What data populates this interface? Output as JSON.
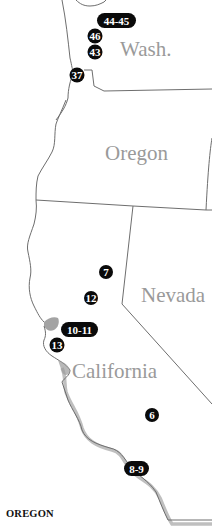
{
  "map": {
    "states": [
      {
        "id": "washington",
        "label": "Wash.",
        "x": 120,
        "y": 50
      },
      {
        "id": "oregon",
        "label": "Oregon",
        "x": 134,
        "y": 160
      },
      {
        "id": "nevada",
        "label": "Nevada",
        "x": 140,
        "y": 294
      },
      {
        "id": "california",
        "label": "California",
        "x": 72,
        "y": 365
      }
    ],
    "markers": [
      {
        "id": "marker-44-45",
        "label": "44-45",
        "x": 110,
        "y": 20,
        "w": 38
      },
      {
        "id": "marker-46",
        "label": "46",
        "x": 95,
        "y": 36,
        "w": 16
      },
      {
        "id": "marker-43",
        "label": "43",
        "x": 95,
        "y": 52,
        "w": 16
      },
      {
        "id": "marker-37",
        "label": "37",
        "x": 77,
        "y": 75,
        "w": 16
      },
      {
        "id": "marker-7",
        "label": "7",
        "x": 106,
        "y": 272,
        "w": 15
      },
      {
        "id": "marker-12",
        "label": "12",
        "x": 91,
        "y": 298,
        "w": 15
      },
      {
        "id": "marker-10-11",
        "label": "10-11",
        "x": 79,
        "y": 330,
        "w": 36
      },
      {
        "id": "marker-13",
        "label": "13",
        "x": 57,
        "y": 345,
        "w": 16
      },
      {
        "id": "marker-6",
        "label": "6",
        "x": 152,
        "y": 415,
        "w": 15
      },
      {
        "id": "marker-8-9",
        "label": "8-9",
        "x": 136,
        "y": 468,
        "w": 24
      }
    ],
    "colors": {
      "marker_fill": "#0a0a0a",
      "label_gray": "#9a9a9a",
      "border": "#6e6e6e",
      "bay": "#8c8c8c"
    }
  },
  "footer": {
    "section_title": "OREGON"
  }
}
